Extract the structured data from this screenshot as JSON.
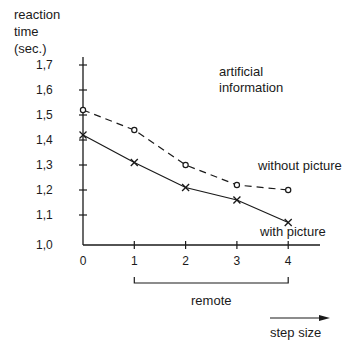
{
  "chart_data": {
    "type": "line",
    "xlabel": "step size",
    "ylabel": "reaction time (sec.)",
    "ylabel_lines": [
      "reaction",
      "time",
      "(sec.)"
    ],
    "title_lines": [
      "artificial",
      "information"
    ],
    "x": [
      0,
      1,
      2,
      3,
      4
    ],
    "x_tick_labels": [
      "0",
      "1",
      "2",
      "3",
      "4"
    ],
    "y_tick_labels": [
      "1,0",
      "1,1",
      "1,2",
      "1,3",
      "1,4",
      "1,5",
      "1,6",
      "1,7"
    ],
    "ylim": [
      1.0,
      1.7
    ],
    "grid": false,
    "series": [
      {
        "name": "without picture",
        "style": "dashed",
        "marker": "circle",
        "values": [
          1.52,
          1.44,
          1.3,
          1.22,
          1.2
        ]
      },
      {
        "name": "with picture",
        "style": "solid",
        "marker": "cross",
        "values": [
          1.42,
          1.31,
          1.21,
          1.16,
          1.07
        ]
      }
    ],
    "annotations": [
      {
        "text": "remote",
        "type": "bracket",
        "from_x": 1,
        "to_x": 4
      },
      {
        "text": "step size",
        "type": "arrow"
      }
    ]
  }
}
